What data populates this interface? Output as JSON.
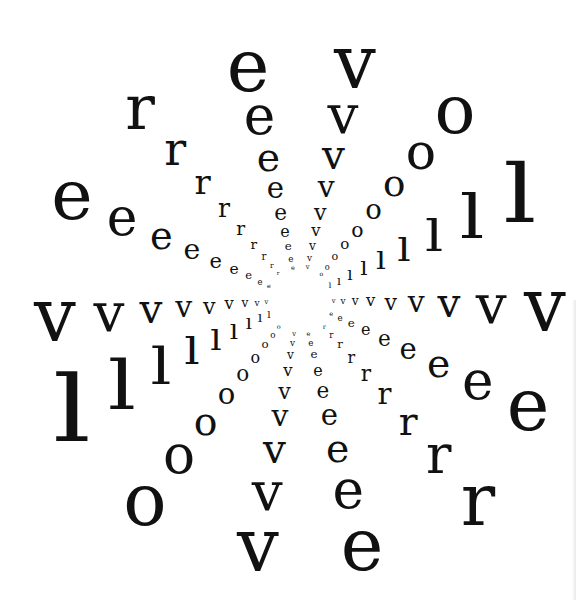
{
  "artwork": {
    "word": "revolver",
    "center": {
      "x": 300,
      "y": 300
    },
    "rings": 9,
    "ink_color": "#111111",
    "background": "#ffffff",
    "spokes": [
      {
        "letter": "r",
        "x": 140,
        "y": 108,
        "size": 62
      },
      {
        "letter": "e",
        "x": 248,
        "y": 66,
        "size": 72
      },
      {
        "letter": "v",
        "x": 355,
        "y": 62,
        "size": 74
      },
      {
        "letter": "o",
        "x": 455,
        "y": 110,
        "size": 68
      },
      {
        "letter": "l",
        "x": 520,
        "y": 195,
        "size": 80
      },
      {
        "letter": "v",
        "x": 545,
        "y": 305,
        "size": 74
      },
      {
        "letter": "e",
        "x": 528,
        "y": 405,
        "size": 72
      },
      {
        "letter": "r",
        "x": 478,
        "y": 500,
        "size": 72
      },
      {
        "letter": "e",
        "x": 362,
        "y": 545,
        "size": 72
      },
      {
        "letter": "v",
        "x": 258,
        "y": 545,
        "size": 74
      },
      {
        "letter": "o",
        "x": 145,
        "y": 500,
        "size": 72
      },
      {
        "letter": "l",
        "x": 72,
        "y": 410,
        "size": 92
      },
      {
        "letter": "v",
        "x": 55,
        "y": 315,
        "size": 74
      },
      {
        "letter": "e",
        "x": 72,
        "y": 195,
        "size": 70
      }
    ]
  }
}
